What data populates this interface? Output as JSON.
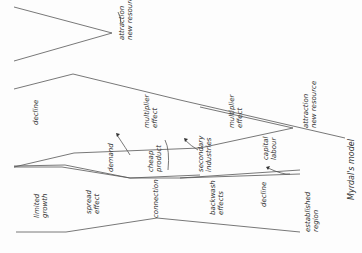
{
  "diagram": {
    "title": "Myrdal's model",
    "line_color": "#555555",
    "labels": {
      "attraction_top": [
        "attraction",
        "new resource"
      ],
      "attraction_mid": [
        "attraction",
        "new resource"
      ],
      "decline_top": "decline",
      "multiplier_1": [
        "multiplier",
        "effect"
      ],
      "multiplier_2": [
        "multiplier",
        "effect"
      ],
      "demand": "demand",
      "cheap_product": [
        "cheap",
        "product"
      ],
      "secondary_industries": [
        "secondary",
        "industries"
      ],
      "capital_labour": [
        "capital",
        "labour"
      ],
      "limited_growth": [
        "limited",
        "growth"
      ],
      "spread_effect": [
        "spread",
        "effect"
      ],
      "connection": "connection",
      "backwash_effects": [
        "backwash",
        "effects"
      ],
      "decline_mid": "decline",
      "established_region": [
        "established",
        "region"
      ]
    }
  }
}
